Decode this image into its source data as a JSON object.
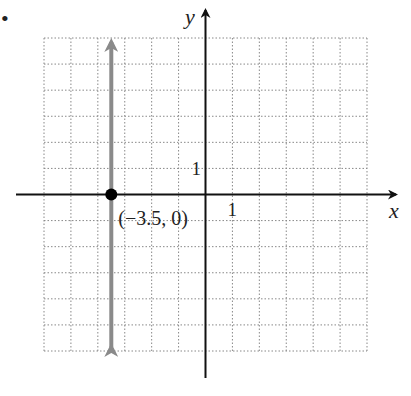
{
  "problem_bullet": "•",
  "chart_data": {
    "type": "line",
    "title": "",
    "xlabel": "x",
    "ylabel": "y",
    "xlim": [
      -6,
      6
    ],
    "ylim": [
      -6,
      6
    ],
    "grid": true,
    "x_tick_label": "1",
    "y_tick_label": "1",
    "series": [
      {
        "name": "vertical line x = -3.5",
        "color": "#8a8a8a",
        "points": [
          [
            -3.5,
            -6
          ],
          [
            -3.5,
            6
          ]
        ],
        "arrows": "both"
      }
    ],
    "points": [
      {
        "x": -3.5,
        "y": 0,
        "label": "(−3.5, 0)",
        "color": "#000000"
      }
    ]
  }
}
